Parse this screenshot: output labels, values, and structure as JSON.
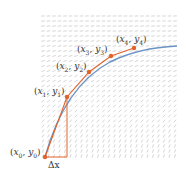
{
  "diagram": {
    "colors": {
      "slope_field": "#b8b8b8",
      "exact_curve": "#6a93c4",
      "euler_path": "#e2622b",
      "points": "#e2622b"
    },
    "points": [
      {
        "label": "(x0, y0)",
        "sub_x": "0",
        "sub_y": "0",
        "x": 45,
        "y": 157
      },
      {
        "label": "(x1, y1)",
        "sub_x": "1",
        "sub_y": "1",
        "x": 67,
        "y": 97
      },
      {
        "label": "(x2, y2)",
        "sub_x": "2",
        "sub_y": "2",
        "x": 89,
        "y": 72
      },
      {
        "label": "(x3, y3)",
        "sub_x": "3",
        "sub_y": "3",
        "x": 111,
        "y": 56
      },
      {
        "label": "(x4, y4)",
        "sub_x": "4",
        "sub_y": "4",
        "x": 134,
        "y": 48
      }
    ],
    "step_label": "Δx",
    "field": {
      "x_start": 43,
      "x_end": 178,
      "y_start": 16,
      "y_end": 158,
      "dx": 5.5,
      "dy": 5
    }
  }
}
